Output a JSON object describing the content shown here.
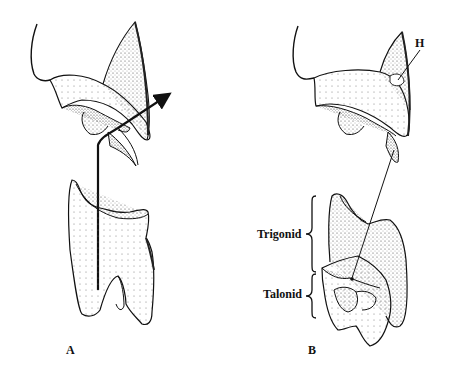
{
  "figure": {
    "panels": [
      {
        "id": "A",
        "label": "A"
      },
      {
        "id": "B",
        "label": "B"
      }
    ],
    "annotations": {
      "H": "H",
      "trigonid": "Trigonid",
      "talonid": "Talonid"
    },
    "colors": {
      "ink": "#111111",
      "stipple": "#555555",
      "background": "#ffffff"
    }
  }
}
